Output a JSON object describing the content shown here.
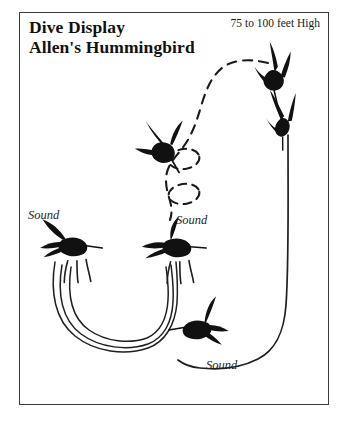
{
  "figure": {
    "title_lines": [
      "Dive Display",
      "Allen's Hummingbird"
    ],
    "altitude_label": "75 to 100 feet High",
    "sound_labels": [
      "Sound",
      "Sound",
      "Sound"
    ],
    "colors": {
      "ink": "#111111",
      "frame": "#3a3a3a",
      "background": "#ffffff",
      "bird_fill": "#111111"
    },
    "icons": {
      "bird_top_right": "hummingbird-diving-icon",
      "bird_upper_right": "hummingbird-plunging-icon",
      "bird_mid_left": "hummingbird-diving-left-icon",
      "bird_left": "hummingbird-hovering-left-icon",
      "bird_mid": "hummingbird-hovering-mid-icon",
      "bird_lower": "hummingbird-climbing-icon"
    },
    "paths": {
      "ascent_dashed": "dashed-ascent-path",
      "loop_upper": "dashed-loop-upper",
      "loop_lower": "dashed-loop-lower",
      "pendulum_arcs": "solid-pendulum-arcs",
      "dive_descent": "solid-dive-descent-path"
    }
  }
}
